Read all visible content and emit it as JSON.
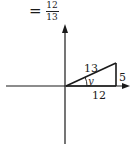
{
  "equation": {
    "sign": "=",
    "numerator": "12",
    "denominator": "13"
  },
  "diagram": {
    "type": "right-triangle-on-axes",
    "labels": {
      "hypotenuse": "13",
      "angle": "y",
      "adjacent": "12",
      "opposite": "5"
    },
    "stroke_color": "#1a1a1a"
  }
}
